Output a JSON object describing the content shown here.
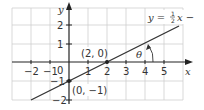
{
  "diagram": {
    "axes": {
      "x_label": "x",
      "y_label": "y",
      "origin_label": "0",
      "x_ticks": [
        "−2",
        "−1",
        "1",
        "2",
        "3",
        "4",
        "5"
      ],
      "y_ticks": [
        "2",
        "1",
        "−1",
        "−2"
      ]
    },
    "line": {
      "equation_prefix": "y = ",
      "equation_frac_num": "1",
      "equation_frac_den": "2",
      "equation_suffix": "x −",
      "color": "#333333"
    },
    "points": [
      {
        "label": "(2, 0)",
        "x": 2,
        "y": 0
      },
      {
        "label": "(0, −1)",
        "x": 0,
        "y": -1
      }
    ],
    "angle_label": "θ",
    "grid_color": "#cfcfcf",
    "axis_color": "#222222"
  }
}
